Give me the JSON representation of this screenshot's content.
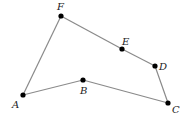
{
  "diagram": {
    "type": "polygon",
    "colors": {
      "edge": "#8a8a8a",
      "vertex": "#000000",
      "label": "#222222",
      "background": "#ffffff"
    },
    "vertices": [
      {
        "id": "A",
        "label": "A",
        "x": 23,
        "y": 95,
        "label_x": 12,
        "label_y": 108
      },
      {
        "id": "B",
        "label": "B",
        "x": 83,
        "y": 80,
        "label_x": 80,
        "label_y": 94
      },
      {
        "id": "C",
        "label": "C",
        "x": 168,
        "y": 103,
        "label_x": 172,
        "label_y": 113
      },
      {
        "id": "D",
        "label": "D",
        "x": 155,
        "y": 66,
        "label_x": 159,
        "label_y": 70
      },
      {
        "id": "E",
        "label": "E",
        "x": 122,
        "y": 49,
        "label_x": 122,
        "label_y": 45
      },
      {
        "id": "F",
        "label": "F",
        "x": 61,
        "y": 16,
        "label_x": 57,
        "label_y": 10
      }
    ],
    "edges": [
      [
        "A",
        "B"
      ],
      [
        "B",
        "C"
      ],
      [
        "C",
        "D"
      ],
      [
        "D",
        "E"
      ],
      [
        "E",
        "F"
      ],
      [
        "F",
        "A"
      ]
    ]
  }
}
